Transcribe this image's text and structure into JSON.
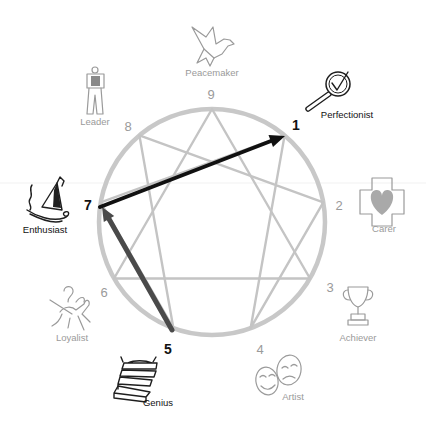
{
  "diagram": {
    "colors": {
      "ring": "#c8c8c8",
      "inner_lines": "#c4c4c4",
      "active_text": "#111111",
      "inactive_text": "#9a9a9a",
      "arrow_primary": "#111111",
      "arrow_secondary": "#4a4a4a"
    },
    "types": {
      "t9": {
        "number": "9",
        "label": "Peacemaker",
        "icon": "dove-icon",
        "active": false
      },
      "t1": {
        "number": "1",
        "label": "Perfectionist",
        "icon": "magnifier-check-icon",
        "active": true
      },
      "t2": {
        "number": "2",
        "label": "Carer",
        "icon": "heart-cross-icon",
        "active": false
      },
      "t3": {
        "number": "3",
        "label": "Achiever",
        "icon": "trophy-icon",
        "active": false
      },
      "t4": {
        "number": "4",
        "label": "Artist",
        "icon": "theater-masks-icon",
        "active": false
      },
      "t5": {
        "number": "5",
        "label": "Genius",
        "icon": "books-icon",
        "active": true
      },
      "t6": {
        "number": "6",
        "label": "Loyalist",
        "icon": "knight-icon",
        "active": false
      },
      "t7": {
        "number": "7",
        "label": "Enthusiast",
        "icon": "sled-icon",
        "active": true
      },
      "t8": {
        "number": "8",
        "label": "Leader",
        "icon": "leader-figure-icon",
        "active": false
      }
    },
    "arrows": [
      {
        "from": "7",
        "to": "1",
        "color": "#111111"
      },
      {
        "from": "5",
        "to": "7",
        "color": "#4a4a4a"
      }
    ],
    "lines": {
      "triangle": [
        "9",
        "3",
        "6"
      ],
      "hexad": [
        "1",
        "4",
        "2",
        "8",
        "5",
        "7"
      ]
    }
  }
}
